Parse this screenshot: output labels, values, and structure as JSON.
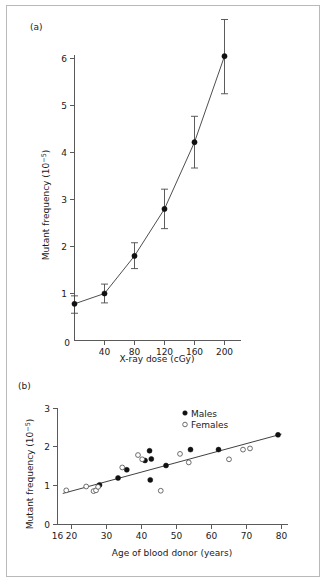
{
  "figure": {
    "background_color": "#ffffff",
    "border_color": "#b9b9b9",
    "axis_color": "#5a5a5a",
    "marker_fill_color": "#111111",
    "marker_open_color": "#ffffff"
  },
  "panel_a": {
    "label": "(a)",
    "xlabel": "X-ray dose (cGy)",
    "ylabel_main": "Mutant frequency (10",
    "ylabel_exponent": "−5",
    "ylabel_close": ")",
    "xticks": [
      "0",
      "40",
      "80",
      "120",
      "160",
      "200"
    ],
    "yticks": [
      "1",
      "2",
      "3",
      "4",
      "5",
      "6"
    ]
  },
  "panel_b": {
    "label": "(b)",
    "xlabel": "Age of blood donor (years)",
    "ylabel_main": "Mutant frequency (10",
    "ylabel_exponent": "−5",
    "ylabel_close": ")",
    "xticks": [
      "16",
      "20",
      "30",
      "40",
      "50",
      "60",
      "70",
      "80"
    ],
    "yticks": [
      "0",
      "1",
      "2",
      "3"
    ],
    "legend": [
      {
        "label": "Males",
        "marker": "filled-circle-icon"
      },
      {
        "label": "Females",
        "marker": "open-circle-icon"
      }
    ]
  },
  "chart_data": [
    {
      "type": "line",
      "panel": "(a)",
      "title": "",
      "xlabel": "X-ray dose (cGy)",
      "ylabel": "Mutant frequency (10^-5)",
      "xlim": [
        0,
        215
      ],
      "ylim": [
        0,
        6.6
      ],
      "xticks": [
        0,
        40,
        80,
        120,
        160,
        200
      ],
      "yticks": [
        1,
        2,
        3,
        4,
        5,
        6
      ],
      "grid": false,
      "legend_position": "none",
      "error_bars": true,
      "x": [
        0,
        40,
        80,
        120,
        160,
        200
      ],
      "y": [
        0.78,
        1.0,
        1.8,
        2.8,
        4.22,
        6.05
      ],
      "yerr_low": [
        0.2,
        0.2,
        0.27,
        0.42,
        0.55,
        0.8
      ],
      "yerr_high": [
        0.17,
        0.2,
        0.28,
        0.42,
        0.55,
        0.78
      ],
      "marker": "filled-circle"
    },
    {
      "type": "scatter",
      "panel": "(b)",
      "title": "",
      "xlabel": "Age of blood donor (years)",
      "ylabel": "Mutant frequency (10^-5)",
      "xlim": [
        16,
        82
      ],
      "ylim": [
        0,
        3.1
      ],
      "xticks": [
        16,
        20,
        30,
        40,
        50,
        60,
        70,
        80
      ],
      "yticks": [
        0,
        1,
        2,
        3
      ],
      "grid": false,
      "legend_position": "top-right",
      "series": [
        {
          "name": "Males",
          "marker": "filled-circle",
          "points": [
            [
              28.0,
              1.02
            ],
            [
              33.3,
              1.2
            ],
            [
              35.8,
              1.41
            ],
            [
              41.0,
              1.65
            ],
            [
              42.3,
              1.9
            ],
            [
              42.8,
              1.69
            ],
            [
              42.5,
              1.15
            ],
            [
              47.0,
              1.52
            ],
            [
              54.0,
              1.93
            ],
            [
              62.0,
              1.93
            ],
            [
              79.0,
              2.31
            ]
          ]
        },
        {
          "name": "Females",
          "marker": "open-circle",
          "points": [
            [
              18.5,
              0.88
            ],
            [
              24.2,
              0.98
            ],
            [
              26.3,
              0.86
            ],
            [
              27.0,
              0.88
            ],
            [
              27.6,
              0.97
            ],
            [
              34.5,
              1.47
            ],
            [
              39.0,
              1.79
            ],
            [
              40.2,
              1.68
            ],
            [
              45.5,
              0.87
            ],
            [
              51.0,
              1.82
            ],
            [
              53.5,
              1.6
            ],
            [
              65.0,
              1.68
            ],
            [
              69.0,
              1.93
            ],
            [
              71.0,
              1.96
            ]
          ]
        }
      ],
      "fit_line": {
        "name": "regression-line",
        "x_start": 17.5,
        "y_start": 0.8,
        "x_end": 80.0,
        "y_end": 2.33
      }
    }
  ]
}
